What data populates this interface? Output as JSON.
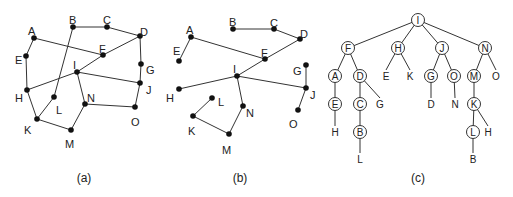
{
  "panels": [
    {
      "id": "a",
      "caption": "(a)",
      "caption_pos": [
        84,
        182
      ],
      "nodes": {
        "A": {
          "x": 34,
          "y": 38,
          "lx": 28,
          "ly": 31
        },
        "B": {
          "x": 73,
          "y": 27,
          "lx": 69,
          "ly": 20
        },
        "C": {
          "x": 107,
          "y": 27,
          "lx": 103,
          "ly": 20
        },
        "D": {
          "x": 140,
          "y": 36,
          "lx": 140,
          "ly": 32
        },
        "E": {
          "x": 26,
          "y": 56,
          "lx": 15,
          "ly": 60
        },
        "F": {
          "x": 103,
          "y": 55,
          "lx": 99,
          "ly": 49
        },
        "G": {
          "x": 141,
          "y": 64,
          "lx": 146,
          "ly": 70
        },
        "H": {
          "x": 27,
          "y": 90,
          "lx": 15,
          "ly": 98
        },
        "I": {
          "x": 77,
          "y": 72,
          "lx": 73,
          "ly": 65
        },
        "J": {
          "x": 140,
          "y": 83,
          "lx": 146,
          "ly": 90
        },
        "K": {
          "x": 37,
          "y": 119,
          "lx": 24,
          "ly": 130
        },
        "L": {
          "x": 54,
          "y": 97,
          "lx": 56,
          "ly": 110
        },
        "M": {
          "x": 71,
          "y": 130,
          "lx": 65,
          "ly": 144
        },
        "N": {
          "x": 85,
          "y": 104,
          "lx": 87,
          "ly": 98
        },
        "O": {
          "x": 135,
          "y": 107,
          "lx": 131,
          "ly": 122
        }
      },
      "edges": [
        [
          "A",
          "E"
        ],
        [
          "E",
          "H"
        ],
        [
          "A",
          "F"
        ],
        [
          "B",
          "C"
        ],
        [
          "C",
          "D"
        ],
        [
          "B",
          "L"
        ],
        [
          "D",
          "G"
        ],
        [
          "G",
          "J"
        ],
        [
          "D",
          "F"
        ],
        [
          "F",
          "I"
        ],
        [
          "I",
          "H"
        ],
        [
          "I",
          "J"
        ],
        [
          "I",
          "N"
        ],
        [
          "N",
          "O"
        ],
        [
          "O",
          "J"
        ],
        [
          "N",
          "M"
        ],
        [
          "M",
          "K"
        ],
        [
          "K",
          "H"
        ],
        [
          "K",
          "L"
        ]
      ]
    },
    {
      "id": "b",
      "caption": "(b)",
      "caption_pos": [
        240,
        182
      ],
      "nodes": {
        "A": {
          "x": 191,
          "y": 37,
          "lx": 186,
          "ly": 30
        },
        "B": {
          "x": 233,
          "y": 29,
          "lx": 229,
          "ly": 22
        },
        "C": {
          "x": 274,
          "y": 29,
          "lx": 270,
          "ly": 23
        },
        "D": {
          "x": 300,
          "y": 39,
          "lx": 300,
          "ly": 34
        },
        "E": {
          "x": 179,
          "y": 61,
          "lx": 173,
          "ly": 51
        },
        "F": {
          "x": 265,
          "y": 59,
          "lx": 261,
          "ly": 53
        },
        "G": {
          "x": 306,
          "y": 65,
          "lx": 293,
          "ly": 71
        },
        "H": {
          "x": 179,
          "y": 89,
          "lx": 166,
          "ly": 98
        },
        "I": {
          "x": 237,
          "y": 76,
          "lx": 233,
          "ly": 69
        },
        "J": {
          "x": 306,
          "y": 88,
          "lx": 310,
          "ly": 95
        },
        "K": {
          "x": 193,
          "y": 116,
          "lx": 188,
          "ly": 131
        },
        "L": {
          "x": 212,
          "y": 98,
          "lx": 218,
          "ly": 102
        },
        "M": {
          "x": 229,
          "y": 134,
          "lx": 222,
          "ly": 150
        },
        "N": {
          "x": 243,
          "y": 106,
          "lx": 246,
          "ly": 113
        },
        "O": {
          "x": 298,
          "y": 110,
          "lx": 289,
          "ly": 124
        }
      },
      "edges": [
        [
          "A",
          "E"
        ],
        [
          "A",
          "F"
        ],
        [
          "B",
          "C"
        ],
        [
          "C",
          "D"
        ],
        [
          "D",
          "F"
        ],
        [
          "F",
          "I"
        ],
        [
          "I",
          "H"
        ],
        [
          "I",
          "J"
        ],
        [
          "I",
          "N"
        ],
        [
          "N",
          "M"
        ],
        [
          "M",
          "K"
        ],
        [
          "K",
          "L"
        ],
        [
          "G",
          "J"
        ],
        [
          "J",
          "O"
        ]
      ]
    },
    {
      "id": "c",
      "caption": "(c)",
      "caption_pos": [
        418,
        182
      ],
      "circled": {
        "I": {
          "x": 418,
          "y": 20
        },
        "F": {
          "x": 348,
          "y": 48
        },
        "H": {
          "x": 398,
          "y": 48
        },
        "J": {
          "x": 442,
          "y": 48
        },
        "N": {
          "x": 485,
          "y": 48
        },
        "A": {
          "x": 335,
          "y": 76
        },
        "D": {
          "x": 360,
          "y": 76
        },
        "G": {
          "x": 431,
          "y": 76
        },
        "O": {
          "x": 454,
          "y": 76
        },
        "M": {
          "x": 474,
          "y": 76
        },
        "E": {
          "x": 335,
          "y": 104
        },
        "C": {
          "x": 360,
          "y": 104
        },
        "K": {
          "x": 474,
          "y": 104
        },
        "B": {
          "x": 360,
          "y": 132
        },
        "L": {
          "x": 473,
          "y": 132
        }
      },
      "plain": [
        {
          "t": "E",
          "x": 386,
          "y": 76
        },
        {
          "t": "K",
          "x": 410,
          "y": 76
        },
        {
          "t": "O",
          "x": 496,
          "y": 76
        },
        {
          "t": "G",
          "x": 380,
          "y": 104
        },
        {
          "t": "D",
          "x": 431,
          "y": 104
        },
        {
          "t": "N",
          "x": 455,
          "y": 104
        },
        {
          "t": "H",
          "x": 335,
          "y": 132
        },
        {
          "t": "H",
          "x": 488,
          "y": 132
        },
        {
          "t": "L",
          "x": 360,
          "y": 159
        },
        {
          "t": "B",
          "x": 473,
          "y": 159
        }
      ],
      "edges": [
        [
          418,
          20,
          348,
          48
        ],
        [
          418,
          20,
          398,
          48
        ],
        [
          418,
          20,
          442,
          48
        ],
        [
          418,
          20,
          485,
          48
        ],
        [
          348,
          48,
          335,
          76
        ],
        [
          348,
          48,
          360,
          76
        ],
        [
          398,
          48,
          386,
          70
        ],
        [
          398,
          48,
          410,
          70
        ],
        [
          442,
          48,
          431,
          76
        ],
        [
          442,
          48,
          454,
          76
        ],
        [
          485,
          48,
          474,
          76
        ],
        [
          485,
          48,
          496,
          70
        ],
        [
          335,
          76,
          335,
          104
        ],
        [
          360,
          76,
          360,
          104
        ],
        [
          360,
          76,
          380,
          98
        ],
        [
          431,
          76,
          431,
          98
        ],
        [
          454,
          76,
          455,
          98
        ],
        [
          474,
          76,
          474,
          104
        ],
        [
          335,
          104,
          335,
          126
        ],
        [
          360,
          104,
          360,
          132
        ],
        [
          474,
          104,
          473,
          132
        ],
        [
          474,
          104,
          488,
          126
        ],
        [
          360,
          132,
          360,
          153
        ],
        [
          473,
          132,
          473,
          153
        ]
      ]
    }
  ]
}
